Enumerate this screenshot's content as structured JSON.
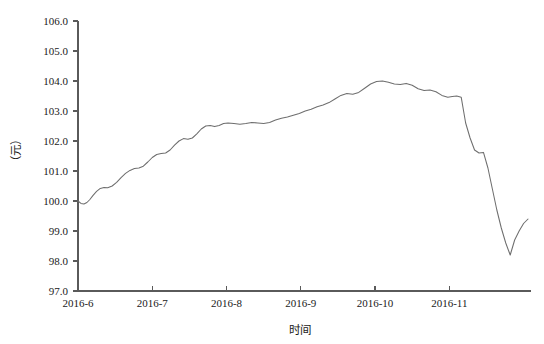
{
  "chart_data": {
    "type": "line",
    "title": "",
    "subtitle": "",
    "xlabel": "时间",
    "ylabel": "（元）",
    "ylim": [
      97.0,
      106.0
    ],
    "ytick_step": 1.0,
    "yticks": [
      "97.0",
      "98.0",
      "99.0",
      "100.0",
      "101.0",
      "102.0",
      "103.0",
      "104.0",
      "105.0",
      "106.0"
    ],
    "ytick_values": [
      97.0,
      98.0,
      99.0,
      100.0,
      101.0,
      102.0,
      103.0,
      104.0,
      105.0,
      106.0
    ],
    "xticks": [
      "2016-6",
      "2016-7",
      "2016-8",
      "2016-9",
      "2016-10",
      "2016-11"
    ],
    "xtick_values": [
      0,
      1,
      2,
      3,
      4,
      5
    ],
    "xlim": [
      0,
      6.1
    ],
    "grid": false,
    "legend": null,
    "legend_position": "none",
    "line_color": "#6e6e6e",
    "axis_color": "#5a5a5a",
    "background_color": "#ffffff",
    "series": [
      {
        "name": "价格",
        "x": [
          0.0,
          0.04,
          0.08,
          0.12,
          0.16,
          0.2,
          0.25,
          0.3,
          0.35,
          0.4,
          0.46,
          0.52,
          0.58,
          0.64,
          0.7,
          0.76,
          0.82,
          0.88,
          0.94,
          1.0,
          1.06,
          1.12,
          1.18,
          1.24,
          1.3,
          1.36,
          1.42,
          1.48,
          1.54,
          1.6,
          1.66,
          1.72,
          1.78,
          1.84,
          1.9,
          1.96,
          2.02,
          2.1,
          2.18,
          2.26,
          2.34,
          2.42,
          2.5,
          2.58,
          2.66,
          2.74,
          2.82,
          2.9,
          2.98,
          3.06,
          3.14,
          3.22,
          3.3,
          3.38,
          3.46,
          3.54,
          3.62,
          3.7,
          3.78,
          3.86,
          3.94,
          4.02,
          4.1,
          4.18,
          4.26,
          4.34,
          4.42,
          4.5,
          4.58,
          4.66,
          4.74,
          4.82,
          4.9,
          4.98,
          5.04,
          5.1,
          5.16,
          5.22,
          5.28,
          5.34,
          5.4,
          5.46,
          5.52,
          5.58,
          5.64,
          5.7,
          5.76,
          5.82,
          5.88,
          5.94,
          6.0,
          6.06
        ],
        "y": [
          100.0,
          99.92,
          99.9,
          99.95,
          100.05,
          100.18,
          100.32,
          100.42,
          100.45,
          100.44,
          100.5,
          100.62,
          100.78,
          100.92,
          101.02,
          101.08,
          101.1,
          101.16,
          101.3,
          101.45,
          101.55,
          101.58,
          101.6,
          101.7,
          101.86,
          102.0,
          102.08,
          102.06,
          102.1,
          102.24,
          102.4,
          102.5,
          102.52,
          102.48,
          102.52,
          102.58,
          102.6,
          102.58,
          102.56,
          102.58,
          102.62,
          102.6,
          102.58,
          102.62,
          102.7,
          102.76,
          102.8,
          102.86,
          102.92,
          103.0,
          103.06,
          103.14,
          103.2,
          103.28,
          103.4,
          103.52,
          103.58,
          103.56,
          103.62,
          103.76,
          103.9,
          103.98,
          104.0,
          103.96,
          103.9,
          103.88,
          103.92,
          103.86,
          103.74,
          103.68,
          103.7,
          103.64,
          103.52,
          103.46,
          103.48,
          103.5,
          103.46,
          102.6,
          102.1,
          101.7,
          101.6,
          101.62,
          101.1,
          100.4,
          99.7,
          99.1,
          98.6,
          98.2,
          98.7,
          99.0,
          99.25,
          99.4
        ]
      }
    ]
  },
  "axes": {
    "y_title": "（元）",
    "x_title": "时间"
  }
}
